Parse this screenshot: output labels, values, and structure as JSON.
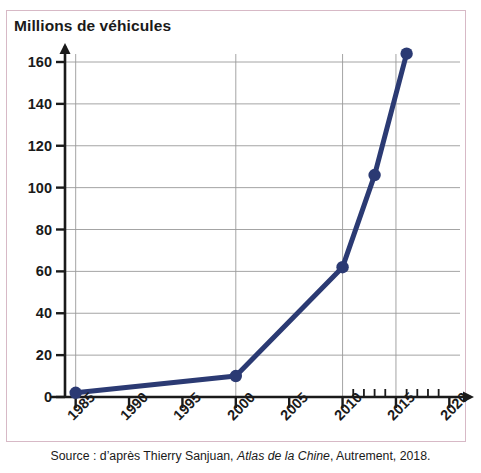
{
  "figure": {
    "axis_title": "Millions de véhicules",
    "source_prefix": "Source : d’après Thierry Sanjuan, ",
    "source_italic": "Atlas de la Chine",
    "source_suffix": ", Autrement, 2018.",
    "frame_color": "#d7b9c6",
    "line_color": "#2b3a73",
    "axis_color": "#1a1a1a",
    "grid_color": "#9a9a9a",
    "background": "#ffffff"
  },
  "chart_data": {
    "type": "line",
    "title": "Millions de véhicules",
    "xlabel": "",
    "ylabel": "Millions de véhicules",
    "xlim": [
      1984,
      2021
    ],
    "ylim": [
      0,
      168
    ],
    "grid": true,
    "legend": "none",
    "x_ticks": [
      1985,
      1990,
      1995,
      2000,
      2005,
      2010,
      2015,
      2020
    ],
    "x_tick_labels": [
      "1985",
      "1990",
      "1995",
      "2000",
      "2005",
      "2010",
      "2015",
      "2020"
    ],
    "x_minor_ticks": [
      2011,
      2012,
      2013,
      2014,
      2016,
      2017,
      2018,
      2019
    ],
    "y_ticks": [
      0,
      20,
      40,
      60,
      80,
      100,
      120,
      140,
      160
    ],
    "y_tick_labels": [
      "0",
      "20",
      "40",
      "60",
      "80",
      "100",
      "120",
      "140",
      "160"
    ],
    "vertical_gridlines_at": [
      1985,
      2000,
      2010,
      2015
    ],
    "series": [
      {
        "name": "Parc de véhicules en Chine",
        "marker": "circle",
        "x": [
          1985,
          2000,
          2010,
          2013,
          2016
        ],
        "y": [
          2,
          10,
          62,
          106,
          164
        ]
      }
    ]
  }
}
